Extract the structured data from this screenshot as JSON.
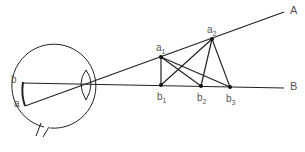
{
  "diagram": {
    "title": "",
    "labels": {
      "A": "A",
      "B": "B",
      "a": "a",
      "b": "b",
      "a1": {
        "base": "a",
        "sub": "1"
      },
      "a2": {
        "base": "a",
        "sub": "2"
      },
      "b1": {
        "base": "b",
        "sub": "1"
      },
      "b2": {
        "base": "b",
        "sub": "2"
      },
      "b3": {
        "base": "b",
        "sub": "3"
      }
    },
    "colors": {
      "line": "#222222",
      "label": "#555555"
    }
  }
}
